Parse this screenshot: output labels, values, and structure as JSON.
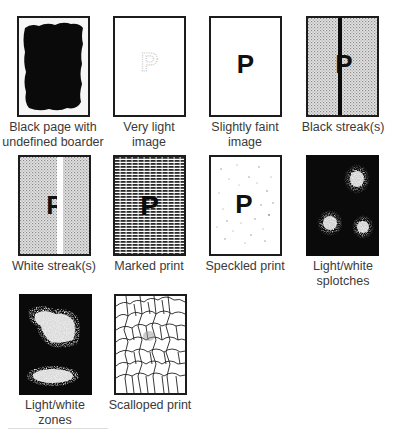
{
  "figure": {
    "items": [
      {
        "id": "black-page",
        "label": "Black page with undefined boarder",
        "line1": "Black page with",
        "line2": "undefined boarder",
        "letter": ""
      },
      {
        "id": "very-light",
        "label": "Very light image",
        "line1": "Very light",
        "line2": "image",
        "letter": "P"
      },
      {
        "id": "slightly-faint",
        "label": "Slightly faint image",
        "line1": "Slightly faint",
        "line2": "image",
        "letter": "P"
      },
      {
        "id": "black-streaks",
        "label": "Black streak(s)",
        "line1": "Black streak(s)",
        "line2": "",
        "letter": "P"
      },
      {
        "id": "white-streaks",
        "label": "White streak(s)",
        "line1": "White streak(s)",
        "line2": "",
        "letter": "P"
      },
      {
        "id": "marked-print",
        "label": "Marked print",
        "line1": "Marked print",
        "line2": "",
        "letter": "P"
      },
      {
        "id": "speckled-print",
        "label": "Speckled print",
        "line1": "Speckled print",
        "line2": "",
        "letter": "P"
      },
      {
        "id": "light-white-splotches",
        "label": "Light/white splotches",
        "line1": "Light/white",
        "line2": "splotches",
        "letter": ""
      },
      {
        "id": "light-white-zones",
        "label": "Light/white zones",
        "line1": "Light/white",
        "line2": "zones",
        "letter": ""
      },
      {
        "id": "scalloped-print",
        "label": "Scalloped print",
        "line1": "Scalloped print",
        "line2": "",
        "letter": ""
      }
    ]
  },
  "colors": {
    "ink": "#1c1c1c",
    "caption": "#3a3a3a",
    "gray_fill": "#cfcfcf",
    "faint": "#bdbdbd"
  }
}
